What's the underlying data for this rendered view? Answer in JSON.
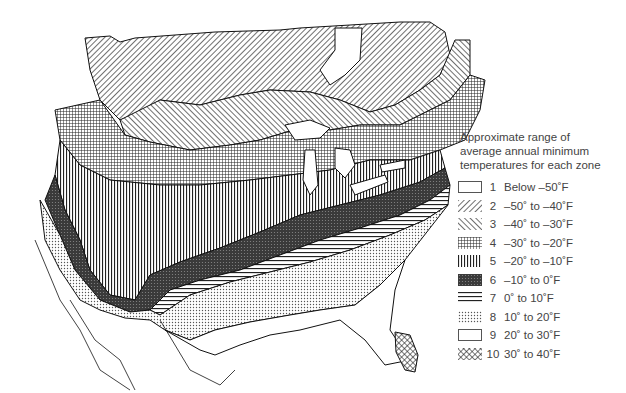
{
  "legend": {
    "title_lines": [
      "Approximate range of",
      "average annual minimum",
      "temperatures for each zone"
    ],
    "zones": [
      {
        "zone": "1",
        "range": "Below –50˚F",
        "pattern": "blank"
      },
      {
        "zone": "2",
        "range": "–50˚ to –40˚F",
        "pattern": "diag-right"
      },
      {
        "zone": "3",
        "range": "–40˚ to –30˚F",
        "pattern": "diag-left"
      },
      {
        "zone": "4",
        "range": "–30˚ to –20˚F",
        "pattern": "grid"
      },
      {
        "zone": "5",
        "range": "–20˚ to –10˚F",
        "pattern": "vertical"
      },
      {
        "zone": "6",
        "range": "–10˚ to 0˚F",
        "pattern": "dense-dark"
      },
      {
        "zone": "7",
        "range": "0˚ to 10˚F",
        "pattern": "horizontal"
      },
      {
        "zone": "8",
        "range": "10˚ to 20˚F",
        "pattern": "dots"
      },
      {
        "zone": "9",
        "range": "20˚ to 30˚F",
        "pattern": "blank"
      },
      {
        "zone": "10",
        "range": "30˚ to 40˚F",
        "pattern": "cross-hatch"
      }
    ]
  },
  "map": {
    "subject": "North America plant hardiness zones",
    "colors": {
      "ink": "#1a1a1a",
      "background": "#ffffff",
      "dark_zone": "#3a3a3a"
    }
  }
}
